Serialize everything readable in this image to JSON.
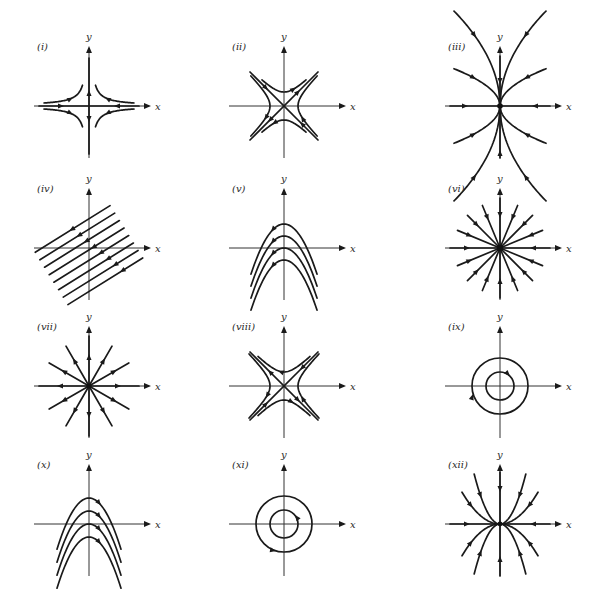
{
  "figure": {
    "ink_color": "#1a1a1a",
    "background": "#ffffff"
  },
  "axis_labels": {
    "x": "x",
    "y": "y"
  },
  "panels": [
    {
      "id": "i",
      "label": "(i)",
      "type": "saddle-axis-aligned",
      "origin": [
        89,
        106
      ]
    },
    {
      "id": "ii",
      "label": "(ii)",
      "type": "saddle-diagonal",
      "origin": [
        284,
        106
      ]
    },
    {
      "id": "iii",
      "label": "(iii)",
      "type": "stable-node-tangent-y",
      "origin": [
        500,
        106
      ]
    },
    {
      "id": "iv",
      "label": "(iv)",
      "type": "parallel-lines",
      "origin": [
        89,
        248
      ]
    },
    {
      "id": "v",
      "label": "(v)",
      "type": "parabolas-flow-left",
      "origin": [
        284,
        248
      ]
    },
    {
      "id": "vi",
      "label": "(vi)",
      "type": "stable-star",
      "origin": [
        500,
        248
      ]
    },
    {
      "id": "vii",
      "label": "(vii)",
      "type": "unstable-star",
      "origin": [
        89,
        386
      ]
    },
    {
      "id": "viii",
      "label": "(viii)",
      "type": "saddle-diagonal-reversed",
      "origin": [
        284,
        386
      ]
    },
    {
      "id": "ix",
      "label": "(ix)",
      "type": "center-clockwise",
      "origin": [
        500,
        386
      ]
    },
    {
      "id": "x",
      "label": "(x)",
      "type": "parabolas-flow-right",
      "origin": [
        89,
        524
      ]
    },
    {
      "id": "xi",
      "label": "(xi)",
      "type": "center-counterclockwise",
      "origin": [
        284,
        524
      ]
    },
    {
      "id": "xii",
      "label": "(xii)",
      "type": "stable-node-tangent-x",
      "origin": [
        500,
        524
      ]
    }
  ]
}
